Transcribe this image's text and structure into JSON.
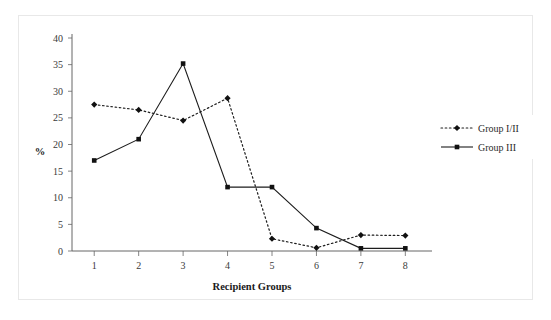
{
  "chart_data": {
    "type": "line",
    "title": "",
    "xlabel": "Recipient Groups",
    "ylabel": "%",
    "categories": [
      "1",
      "2",
      "3",
      "4",
      "5",
      "6",
      "7",
      "8"
    ],
    "x": [
      1,
      2,
      3,
      4,
      5,
      6,
      7,
      8
    ],
    "ylim": [
      0,
      40
    ],
    "xlim": [
      0.5,
      8.6
    ],
    "yticks": [
      0,
      5,
      10,
      15,
      20,
      25,
      30,
      35,
      40
    ],
    "ytick_labels": [
      "0",
      "5",
      "10",
      "15",
      "20",
      "25",
      "30",
      "35",
      "40"
    ],
    "xtick_labels": [
      "1",
      "2",
      "3",
      "4",
      "5",
      "6",
      "7",
      "8"
    ],
    "grid": false,
    "legend_position": "right",
    "series": [
      {
        "name": "Group I/II",
        "style": "dotted",
        "marker": "diamond",
        "color": "#111111",
        "values": [
          27.5,
          26.5,
          24.5,
          28.7,
          2.3,
          0.6,
          3.0,
          2.9
        ]
      },
      {
        "name": "Group III",
        "style": "solid",
        "marker": "square",
        "color": "#111111",
        "values": [
          17.0,
          21.0,
          35.2,
          12.0,
          12.0,
          4.3,
          0.5,
          0.5
        ]
      }
    ]
  },
  "axes": {
    "y_axis_label": "%",
    "x_axis_label": "Recipient Groups"
  },
  "legend": {
    "entries": [
      {
        "label": "Group I/II"
      },
      {
        "label": "Group III"
      }
    ]
  }
}
